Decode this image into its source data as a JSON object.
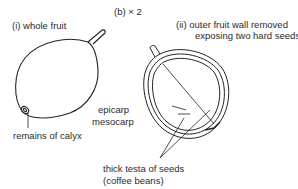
{
  "figure": {
    "heading": "(b)  × 2",
    "panel_i": {
      "title": "(i)  whole fruit",
      "labels": {
        "calyx": "remains of calyx"
      }
    },
    "panel_ii": {
      "title_line1": "(ii)  outer fruit wall removed",
      "title_line2": "exposing two hard seeds",
      "labels": {
        "epicarp": "epicarp",
        "mesocarp": "mesocarp",
        "testa_line1": "thick testa of seeds",
        "testa_line2": "(coffee beans)"
      }
    }
  }
}
